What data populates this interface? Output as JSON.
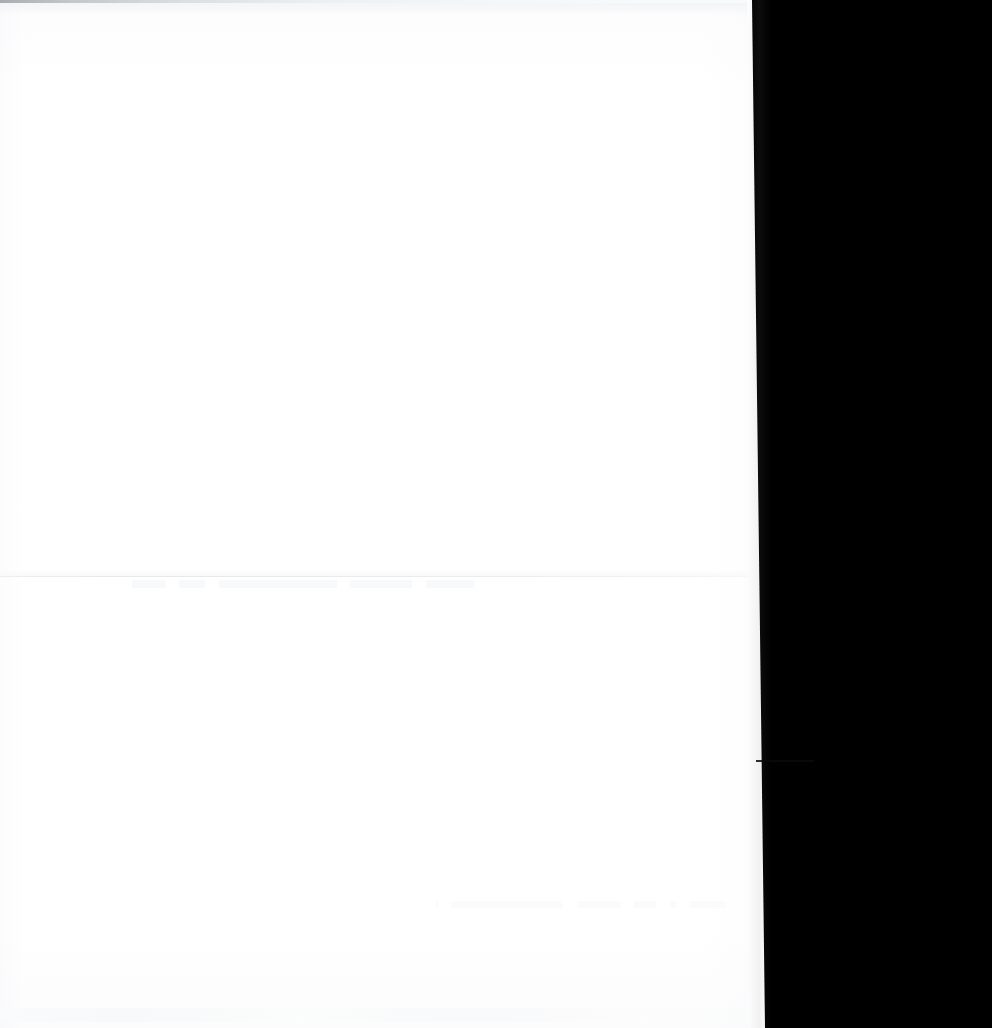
{
  "document": {
    "title": "",
    "body_text": "",
    "notes": "Overexposed / blank scanned page with no legible rendered text."
  },
  "page": {
    "surface_label": "",
    "top_rule_label": "",
    "divider_label": "",
    "bottom_smudge_label": ""
  },
  "ghost_text": {
    "upper_line": "",
    "lower_line": ""
  },
  "band": {
    "label": "",
    "streak_label": ""
  },
  "colors": {
    "page_background": "#ffffff",
    "paper_tint": "#fcfcfd",
    "top_rule": "#9aa0a6",
    "divider": "#e6e8ea",
    "ghost_text": "#f8f9fa",
    "band": "#000000",
    "band_streak": "#0a0a0a"
  },
  "geometry": {
    "canvas_width": 992,
    "canvas_height": 1028,
    "page_width": 755,
    "divider_y": 576,
    "band_left_top": 750,
    "band_left_bottom": 765
  }
}
